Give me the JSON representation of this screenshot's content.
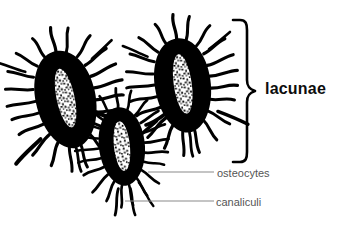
{
  "figure": {
    "background_color": "#ffffff",
    "width": 345,
    "height": 231
  },
  "labels": {
    "lacunae": "lacunae",
    "osteocytes": "osteocytes",
    "canaliculi": "canaliculi"
  },
  "colors": {
    "ink": "#000000",
    "leader_line": "#8a8a8a",
    "label_text": "#555555",
    "bold_label_text": "#0d0d0d",
    "nucleus_fill": "#ffffff"
  },
  "annotations": {
    "brace": {
      "name": "lacunae-brace",
      "orientation": "left-facing-curly-brace",
      "top": 20,
      "bottom": 162,
      "tip_x": 255,
      "label": "lacunae"
    },
    "leaders": [
      {
        "name": "osteocytes-leader",
        "label": "osteocytes",
        "x1": 148,
        "x2": 214,
        "y": 172
      },
      {
        "name": "canaliculi-leader",
        "label": "canaliculi",
        "x1": 125,
        "x2": 214,
        "y": 201
      }
    ]
  },
  "cells": [
    {
      "name": "osteocyte-left",
      "center_x": 66,
      "center_y": 100,
      "body_rx": 30,
      "body_ry": 48,
      "rotation": -12,
      "nucleus_rx": 9,
      "nucleus_ry": 30,
      "canaliculi_count": 26
    },
    {
      "name": "osteocyte-middle",
      "center_x": 122,
      "center_y": 147,
      "body_rx": 23,
      "body_ry": 38,
      "rotation": -6,
      "nucleus_rx": 8,
      "nucleus_ry": 25,
      "canaliculi_count": 24
    },
    {
      "name": "osteocyte-right",
      "center_x": 183,
      "center_y": 86,
      "body_rx": 28,
      "body_ry": 46,
      "rotation": -8,
      "nucleus_rx": 9,
      "nucleus_ry": 30,
      "canaliculi_count": 26
    }
  ]
}
